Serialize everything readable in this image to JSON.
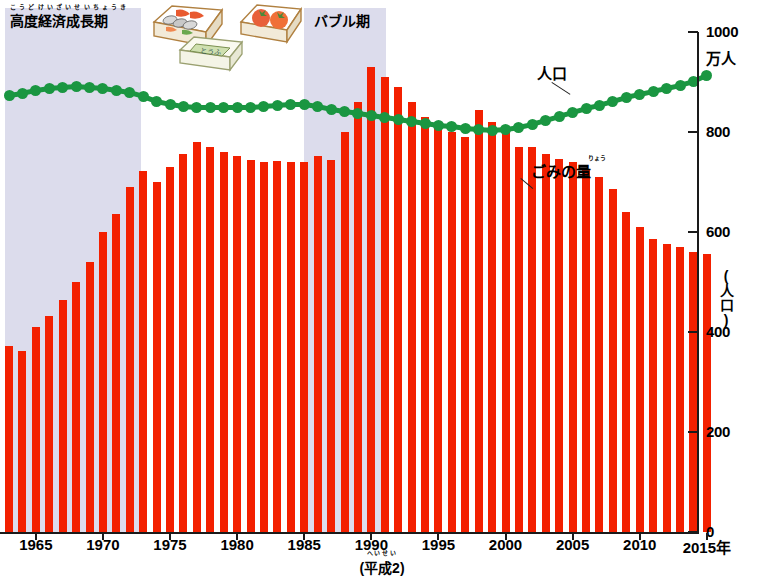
{
  "chart_data": {
    "type": "bar",
    "title": "",
    "xlabel": "年",
    "ylabel": "(人口)",
    "y_unit_top": "万人",
    "ylim": [
      0,
      1000
    ],
    "yticks": [
      0,
      200,
      400,
      600,
      800,
      1000
    ],
    "ytick_labels": [
      "0",
      "200",
      "400",
      "600",
      "800",
      "1000"
    ],
    "xticks": [
      1965,
      1970,
      1975,
      1980,
      1985,
      1990,
      1995,
      2000,
      2005,
      2010,
      2015
    ],
    "xtick_labels": [
      "1965",
      "1970",
      "1975",
      "1980",
      "1985",
      "1990",
      "1995",
      "2000",
      "2005",
      "2010",
      "2015年"
    ],
    "grid": false,
    "legend_position": "inline-annotations",
    "x": [
      1963,
      1964,
      1965,
      1966,
      1967,
      1968,
      1969,
      1970,
      1971,
      1972,
      1973,
      1974,
      1975,
      1976,
      1977,
      1978,
      1979,
      1980,
      1981,
      1982,
      1983,
      1984,
      1985,
      1986,
      1987,
      1988,
      1989,
      1990,
      1991,
      1992,
      1993,
      1994,
      1995,
      1996,
      1997,
      1998,
      1999,
      2000,
      2001,
      2002,
      2003,
      2004,
      2005,
      2006,
      2007,
      2008,
      2009,
      2010,
      2011,
      2012,
      2013,
      2014,
      2015
    ],
    "series": [
      {
        "name": "ごみの量",
        "type": "bar",
        "color": "#f32000",
        "values": [
          372,
          362,
          410,
          432,
          464,
          500,
          540,
          600,
          636,
          690,
          722,
          700,
          730,
          756,
          780,
          770,
          760,
          752,
          744,
          740,
          742,
          740,
          740,
          752,
          744,
          800,
          860,
          930,
          910,
          890,
          860,
          830,
          810,
          800,
          790,
          844,
          820,
          800,
          770,
          770,
          756,
          746,
          740,
          726,
          710,
          686,
          640,
          610,
          586,
          576,
          570,
          560,
          556
        ]
      },
      {
        "name": "人口",
        "type": "line",
        "color": "#1a9641",
        "values": [
          874,
          878,
          884,
          888,
          890,
          892,
          890,
          888,
          884,
          880,
          872,
          862,
          856,
          852,
          850,
          850,
          850,
          850,
          850,
          852,
          854,
          856,
          856,
          852,
          846,
          842,
          838,
          834,
          830,
          826,
          822,
          818,
          814,
          812,
          808,
          806,
          804,
          806,
          810,
          816,
          824,
          832,
          840,
          848,
          854,
          862,
          870,
          876,
          882,
          888,
          894,
          902,
          914
        ]
      }
    ],
    "annotations": [
      {
        "name": "era-growth",
        "text": "高度経済成長期",
        "ruby": "こうどけいざいせいちょうき",
        "x_start": 1963,
        "x_end": 1973
      },
      {
        "name": "era-bubble",
        "text": "バブル期",
        "ruby": "",
        "x_start": 1986,
        "x_end": 1992
      },
      {
        "name": "population-label",
        "text": "人口"
      },
      {
        "name": "garbage-label",
        "text": "ごみの量",
        "ruby": "りょう"
      },
      {
        "name": "heisei-note",
        "text": "(平成2)",
        "ruby": "へいせい"
      }
    ],
    "illustrations": [
      "bento-box-icon",
      "tomato-pack-icon",
      "tofu-pack-icon"
    ]
  },
  "colors": {
    "bar": "#f32000",
    "line": "#1a9641",
    "band": "#dcdcec",
    "axis": "#1a1a1a",
    "background": "#ffffff"
  }
}
